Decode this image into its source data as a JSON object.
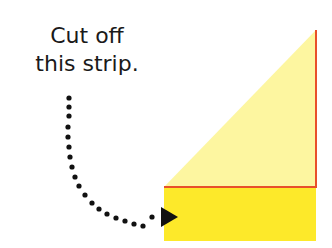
{
  "caption": {
    "line1": "Cut off",
    "line2": "this strip."
  },
  "colors": {
    "triangle_fill": "#fdf6a0",
    "strip_fill": "#fde92a",
    "fold_line": "#e8502a",
    "arrow": "#111111",
    "background": "#ffffff"
  },
  "shapes": {
    "triangle": {
      "apex": [
        316,
        30
      ],
      "base_left": [
        164,
        187
      ],
      "base_right": [
        316,
        187
      ]
    },
    "strip": {
      "x": 164,
      "y": 187,
      "width": 152,
      "height": 54
    },
    "arrow_target": [
      178,
      217
    ]
  }
}
